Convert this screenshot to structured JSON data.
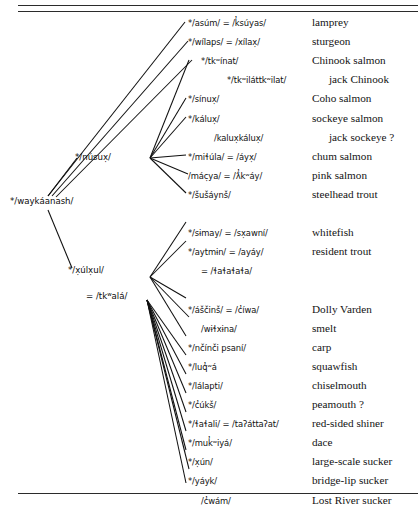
{
  "figure": {
    "ink_color": "#101010",
    "rules": {
      "top_count": 2,
      "bottom_count": 1
    }
  },
  "nodes": {
    "root": "*/waykáanash/",
    "branch1": "*/núsux̣/",
    "branch2": "*/x̣úlx̣ul/",
    "branch2_alt": "= /tkʷalá/"
  },
  "entries": [
    {
      "form": "*/asúm/ = /k̓súyas/",
      "gloss": "lamprey",
      "indent": 0,
      "gloss_indent": 0,
      "row": 0,
      "group": "nusux",
      "branch": true
    },
    {
      "form": "*/wílaps/ = /xílax̣/",
      "gloss": "sturgeon",
      "indent": 0,
      "gloss_indent": 0,
      "row": 1,
      "group": "nusux",
      "branch": true
    },
    {
      "form": "*/tkʷínat/",
      "gloss": "Chinook salmon",
      "indent": 1,
      "gloss_indent": 0,
      "row": 2,
      "group": "nusux",
      "branch": true
    },
    {
      "form": "*/tkʷiláttkʷilat/",
      "gloss": "jack Chinook",
      "indent": 3,
      "gloss_indent": 1,
      "row": 3,
      "group": "nusux",
      "branch": false
    },
    {
      "form": "*/sínux̣/",
      "gloss": "Coho salmon",
      "indent": 0,
      "gloss_indent": 0,
      "row": 4,
      "group": "nusux",
      "branch": true
    },
    {
      "form": "*/kálux̣/",
      "gloss": "sockeye salmon",
      "indent": 0,
      "gloss_indent": 0,
      "row": 5,
      "group": "nusux",
      "branch": true
    },
    {
      "form": "/kalux̣kálux̣/",
      "gloss": "jack sockeye ?",
      "indent": 2,
      "gloss_indent": 1,
      "row": 6,
      "group": "nusux",
      "branch": false
    },
    {
      "form": "*/miɬúla/ = /áyx̣/",
      "gloss": "chum salmon",
      "indent": 0,
      "gloss_indent": 0,
      "row": 7,
      "group": "nusux",
      "branch": true
    },
    {
      "form": "/mác̣ya/ = /ƛ̓kʷáy/",
      "gloss": "pink salmon",
      "indent": 0,
      "gloss_indent": 0,
      "row": 8,
      "group": "nusux",
      "branch": true
    },
    {
      "form": "*/šušáynš/",
      "gloss": "steelhead trout",
      "indent": 0,
      "gloss_indent": 0,
      "row": 9,
      "group": "nusux",
      "branch": true
    },
    {
      "form": "*/sɨmay/ = /sx̣awní/",
      "gloss": "whitefish",
      "indent": 0,
      "gloss_indent": 0,
      "row": 11,
      "group": "xulxul_a",
      "branch": true
    },
    {
      "form": "*/aytmɨn/ = /ayáy/",
      "gloss": "resident trout",
      "indent": 0,
      "gloss_indent": 0,
      "row": 12,
      "group": "xulxul_a",
      "branch": true
    },
    {
      "form": "= /ɬaɬaɬaɬa/",
      "gloss": "",
      "indent": 1,
      "gloss_indent": 0,
      "row": 13,
      "group": "xulxul_a",
      "branch": false
    },
    {
      "form": "*/áščinš/ = /c̓íwa/",
      "gloss": "Dolly Varden",
      "indent": 0,
      "gloss_indent": 0,
      "row": 15,
      "group": "xulxul_b",
      "branch": true
    },
    {
      "form": "/wɨɬxɨna/",
      "gloss": "smelt",
      "indent": 1,
      "gloss_indent": 0,
      "row": 16,
      "group": "xulxul_b",
      "branch": true
    },
    {
      "form": "*/nčínči psaní/",
      "gloss": "carp",
      "indent": 0,
      "gloss_indent": 0,
      "row": 17,
      "group": "xulxul_b",
      "branch": true
    },
    {
      "form": "*/luq̓ʷá",
      "gloss": "squawfish",
      "indent": 0,
      "gloss_indent": 0,
      "row": 18,
      "group": "xulxul_b",
      "branch": true
    },
    {
      "form": "*/lálapti/",
      "gloss": "chiselmouth",
      "indent": 0,
      "gloss_indent": 0,
      "row": 19,
      "group": "xulxul_b",
      "branch": true
    },
    {
      "form": "*/c̓úkš/",
      "gloss": "peamouth ?",
      "indent": 0,
      "gloss_indent": 0,
      "row": 20,
      "group": "xulxul_b",
      "branch": true
    },
    {
      "form": "*/ɬaɬali/ = /taʔáttaʔat/",
      "gloss": "red-sided shiner",
      "indent": 0,
      "gloss_indent": 0,
      "row": 21,
      "group": "xulxul_b",
      "branch": true
    },
    {
      "form": "*/muk̓ʷiyá/",
      "gloss": "dace",
      "indent": 0,
      "gloss_indent": 0,
      "row": 22,
      "group": "xulxul_b",
      "branch": true
    },
    {
      "form": "*/x̣ún/",
      "gloss": "large-scale sucker",
      "indent": 0,
      "gloss_indent": 0,
      "row": 23,
      "group": "xulxul_b",
      "branch": true
    },
    {
      "form": "*/yáyk/",
      "gloss": "bridge-lip sucker",
      "indent": 0,
      "gloss_indent": 0,
      "row": 24,
      "group": "xulxul_b",
      "branch": true
    },
    {
      "form": "/c̓wám/",
      "gloss": "Lost River sucker",
      "indent": 1,
      "gloss_indent": 0,
      "row": 25,
      "group": "xulxul_b",
      "branch": true
    },
    {
      "form": "*/k̓ʷašlá/",
      "gloss": "sculpin",
      "indent": 0,
      "gloss_indent": 0,
      "row": 26,
      "group": "xulxul_b",
      "branch": true
    }
  ]
}
